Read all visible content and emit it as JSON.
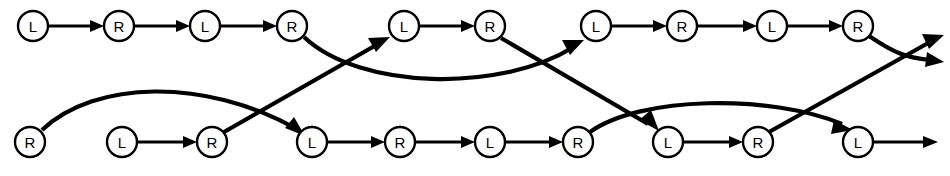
{
  "diagram": {
    "type": "directed-graph",
    "width": 950,
    "height": 176,
    "background_color": "#ffffff",
    "stroke_color": "#000000",
    "node_fill_color": "#ffffff",
    "node_radius": 15,
    "rows": [
      {
        "id": "top-row",
        "y": 26,
        "nodes": [
          {
            "id": "t0",
            "label": "L",
            "x": 33
          },
          {
            "id": "t1",
            "label": "R",
            "x": 119
          },
          {
            "id": "t2",
            "label": "L",
            "x": 205
          },
          {
            "id": "t3",
            "label": "R",
            "x": 292
          },
          {
            "id": "t4",
            "label": "L",
            "x": 404
          },
          {
            "id": "t5",
            "label": "R",
            "x": 490
          },
          {
            "id": "t6",
            "label": "L",
            "x": 596
          },
          {
            "id": "t7",
            "label": "R",
            "x": 682
          },
          {
            "id": "t8",
            "label": "L",
            "x": 772
          },
          {
            "id": "t9",
            "label": "R",
            "x": 858
          }
        ]
      },
      {
        "id": "bottom-row",
        "y": 142,
        "nodes": [
          {
            "id": "b0",
            "label": "R",
            "x": 30
          },
          {
            "id": "b1",
            "label": "L",
            "x": 122
          },
          {
            "id": "b2",
            "label": "R",
            "x": 212
          },
          {
            "id": "b3",
            "label": "L",
            "x": 312
          },
          {
            "id": "b4",
            "label": "R",
            "x": 400
          },
          {
            "id": "b5",
            "label": "L",
            "x": 490
          },
          {
            "id": "b6",
            "label": "R",
            "x": 578
          },
          {
            "id": "b7",
            "label": "L",
            "x": 668
          },
          {
            "id": "b8",
            "label": "R",
            "x": 758
          },
          {
            "id": "b9",
            "label": "L",
            "x": 858
          }
        ]
      }
    ],
    "edges": [
      {
        "id": "e-t0-t1",
        "kind": "straight",
        "from": "t0",
        "to": "t1",
        "arrow": true
      },
      {
        "id": "e-t1-t2",
        "kind": "straight",
        "from": "t1",
        "to": "t2",
        "arrow": true
      },
      {
        "id": "e-t2-t3",
        "kind": "straight",
        "from": "t2",
        "to": "t3",
        "arrow": true
      },
      {
        "id": "e-t4-t5",
        "kind": "straight",
        "from": "t4",
        "to": "t5",
        "arrow": true
      },
      {
        "id": "e-t6-t7",
        "kind": "straight",
        "from": "t6",
        "to": "t7",
        "arrow": true
      },
      {
        "id": "e-t7-t8",
        "kind": "straight",
        "from": "t7",
        "to": "t8",
        "arrow": true
      },
      {
        "id": "e-t8-t9",
        "kind": "straight",
        "from": "t8",
        "to": "t9",
        "arrow": true
      },
      {
        "id": "e-b1-b2",
        "kind": "straight",
        "from": "b1",
        "to": "b2",
        "arrow": true
      },
      {
        "id": "e-b3-b4",
        "kind": "straight",
        "from": "b3",
        "to": "b4",
        "arrow": true
      },
      {
        "id": "e-b4-b5",
        "kind": "straight",
        "from": "b4",
        "to": "b5",
        "arrow": true
      },
      {
        "id": "e-b5-b6",
        "kind": "straight",
        "from": "b5",
        "to": "b6",
        "arrow": true
      },
      {
        "id": "e-b7-b8",
        "kind": "straight",
        "from": "b7",
        "to": "b8",
        "arrow": true
      },
      {
        "id": "e-b9-out",
        "kind": "straight-open",
        "from": "b9",
        "to": "edge-right",
        "arrow": true
      },
      {
        "id": "e-b0-b3-arc",
        "kind": "arc-over-bottom",
        "from": "b0",
        "to": "b3",
        "arrow": true
      },
      {
        "id": "e-b2-t4-cross",
        "kind": "cross-up",
        "from": "b2",
        "to": "t4",
        "arrow": true
      },
      {
        "id": "e-t3-t6-arc",
        "kind": "arc-under-top",
        "from": "t3",
        "to": "t6",
        "arrow": true
      },
      {
        "id": "e-t5-b7-cross",
        "kind": "cross-down",
        "from": "t5",
        "to": "b7",
        "arrow": true
      },
      {
        "id": "e-b6-b9-arc",
        "kind": "arc-over-bottom",
        "from": "b6",
        "to": "b9",
        "arrow": true
      },
      {
        "id": "e-t9-out-curve",
        "kind": "curve-out-down",
        "from": "t9",
        "to": "edge-right-lower",
        "arrow": true
      },
      {
        "id": "e-b8-out-cross",
        "kind": "cross-up-out",
        "from": "b8",
        "to": "edge-right-upper",
        "arrow": true
      }
    ]
  }
}
